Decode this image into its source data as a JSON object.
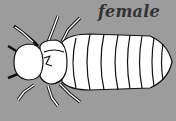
{
  "image": {
    "subject": "insect larva illustration",
    "label": "female",
    "background_color": "#9c9c9c",
    "body_color": "#ffffff",
    "outline_color": "#111111",
    "label_color": "#333333",
    "abdomen_segments": 8,
    "legs": 6
  }
}
